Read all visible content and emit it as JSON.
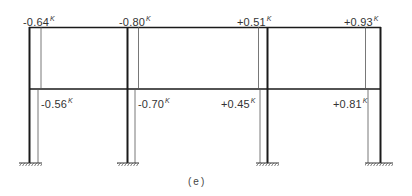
{
  "diagram": {
    "type": "two-storey three-bay portal frame with column moment diagrams",
    "caption": "(e)",
    "unit_superscript": "K",
    "colors": {
      "frame": "#1a1a1a",
      "diagram": "#555555",
      "text": "#333333"
    },
    "upper_storey_labels": [
      {
        "value": "-0.64",
        "unit": "K"
      },
      {
        "value": "-0.80",
        "unit": "K"
      },
      {
        "value": "+0.51",
        "unit": "K"
      },
      {
        "value": "+0.93",
        "unit": "K"
      }
    ],
    "lower_storey_labels": [
      {
        "value": "-0.56",
        "unit": "K"
      },
      {
        "value": "-0.70",
        "unit": "K"
      },
      {
        "value": "+0.45",
        "unit": "K"
      },
      {
        "value": "+0.81",
        "unit": "K"
      }
    ],
    "supports": [
      "fixed",
      "fixed",
      "fixed",
      "fixed"
    ]
  }
}
